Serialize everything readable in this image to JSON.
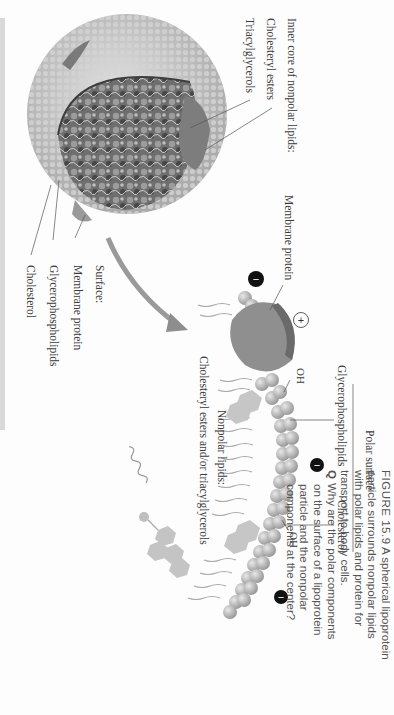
{
  "figure": {
    "number": "FIGURE 15.9",
    "caption_lines": [
      "A spherical lipoprotein",
      "particle surrounds nonpolar lipids",
      "with polar lipids and protein for",
      "transport to body cells."
    ],
    "question_marker": "Q",
    "question_lines": [
      "Why are the polar components",
      "on the surface of a lipoprotein",
      "particle and the nonpolar",
      "components at the center?"
    ]
  },
  "sphere_labels": {
    "inner_core_heading": "Inner core of nonpolar lipids:",
    "cholesteryl_esters": "Cholesteryl esters",
    "triacylglycerols": "Triacylglycerols",
    "surface_heading": "Surface:",
    "membrane_protein": "Membrane protein",
    "glycerophospholipids": "Glycerophospholipids",
    "cholesterol": "Cholesterol"
  },
  "detail_labels": {
    "membrane_protein": "Membrane protein",
    "polar_surface": "Polar surface",
    "glycerophospholipids": "Glycerophospholipids",
    "cholesterol": "Cholesterol",
    "oh_1": "OH",
    "oh_2": "OH",
    "nonpolar_heading": "Nonpolar lipids:",
    "nonpolar_items": "Cholesteryl esters and/or triacylglycerols",
    "plus_charge": "+",
    "minus_charge": "−"
  },
  "colors": {
    "sphere_surface": "#bcbcbc",
    "core_dark": "#5a5a5a",
    "protein": "#8a8a8a",
    "charge_badge": "#111111"
  }
}
